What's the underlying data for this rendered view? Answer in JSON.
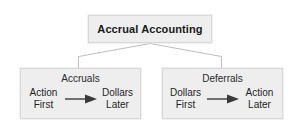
{
  "diagram": {
    "type": "hierarchy",
    "root": {
      "label": "Accrual Accounting"
    },
    "children": [
      {
        "title": "Accruals",
        "flow": {
          "from_line1": "Action",
          "from_line2": "First",
          "arrow_icon": "arrow-right-icon",
          "to_line1": "Dollars",
          "to_line2": "Later"
        }
      },
      {
        "title": "Deferrals",
        "flow": {
          "from_line1": "Dollars",
          "from_line2": "First",
          "arrow_icon": "arrow-right-icon",
          "to_line1": "Action",
          "to_line2": "Later"
        }
      }
    ],
    "colors": {
      "box_fill": "#eeeeee",
      "box_border": "#d8d8d8",
      "connector": "#bdbdbd",
      "arrow": "#3a3a3a",
      "text": "#1a1a1a",
      "background": "#ffffff"
    }
  }
}
